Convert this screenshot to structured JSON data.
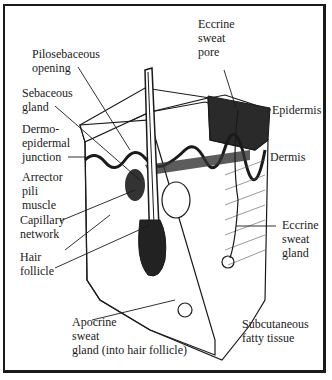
{
  "diagram": {
    "labels": {
      "pilosebaceous_opening": "Pilosebaceous\nopening",
      "sebaceous_gland": "Sebaceous\ngland",
      "dermo_epidermal_junction": "Dermo-\nepidermal\njunction",
      "arrector_pili_muscle": "Arrector\npili\nmuscle",
      "capillary_network": "Capillary\nnetwork",
      "hair_follicle": "Hair\nfollicle",
      "apocrine_sweat_gland": "Apocrine\nsweat\ngland (into hair follicle)",
      "eccrine_sweat_pore": "Eccrine\nsweat\npore",
      "epidermis": "Epidermis",
      "dermis": "Dermis",
      "eccrine_sweat_gland": "Eccrine\nsweat\ngland",
      "subcutaneous_fatty_tissue": "Subcutaneous\nfatty tissue"
    },
    "colors": {
      "ink": "#1a1a1a",
      "background": "#ffffff"
    }
  }
}
